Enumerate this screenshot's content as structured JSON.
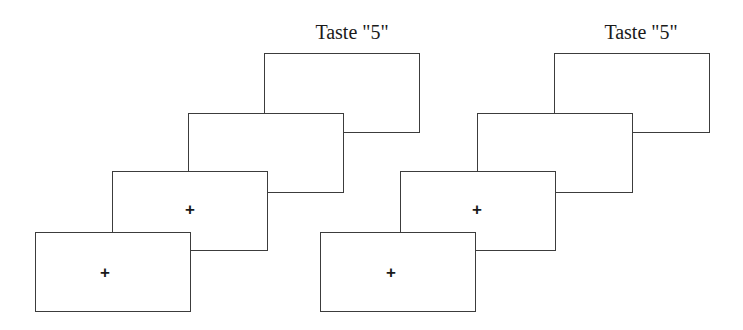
{
  "figure": {
    "canvas": {
      "width": 743,
      "height": 330
    },
    "background_color": "#ffffff",
    "line_color": "#3c3c3c",
    "text_color": "#1a1a1a",
    "fixation_glyph": "+"
  },
  "sequences": [
    {
      "id": "sequence-left",
      "name": "left-trial-sequence",
      "key_label": {
        "text": "Taste \"5\"",
        "x": 352,
        "y": 22
      },
      "screens": [
        {
          "id": "left-screen-4",
          "name": "left-screen-4-response",
          "order": 4,
          "x": 264,
          "y": 53,
          "width": 156,
          "height": 80,
          "fixation": null
        },
        {
          "id": "left-screen-3",
          "name": "left-screen-3-blank",
          "order": 3,
          "x": 188,
          "y": 113,
          "width": 156,
          "height": 80,
          "fixation": null
        },
        {
          "id": "left-screen-2",
          "name": "left-screen-2-fixation",
          "order": 2,
          "x": 112,
          "y": 171,
          "width": 156,
          "height": 80,
          "fixation": {
            "x": 190,
            "y": 209
          }
        },
        {
          "id": "left-screen-1",
          "name": "left-screen-1-fixation",
          "order": 1,
          "x": 35,
          "y": 232,
          "width": 156,
          "height": 80,
          "fixation": {
            "x": 105,
            "y": 272
          }
        }
      ]
    },
    {
      "id": "sequence-right",
      "name": "right-trial-sequence",
      "key_label": {
        "text": "Taste \"5\"",
        "x": 641,
        "y": 22
      },
      "screens": [
        {
          "id": "right-screen-4",
          "name": "right-screen-4-response",
          "order": 4,
          "x": 554,
          "y": 53,
          "width": 156,
          "height": 80,
          "fixation": null
        },
        {
          "id": "right-screen-3",
          "name": "right-screen-3-blank",
          "order": 3,
          "x": 477,
          "y": 113,
          "width": 156,
          "height": 80,
          "fixation": null
        },
        {
          "id": "right-screen-2",
          "name": "right-screen-2-fixation",
          "order": 2,
          "x": 400,
          "y": 171,
          "width": 156,
          "height": 80,
          "fixation": {
            "x": 477,
            "y": 209
          }
        },
        {
          "id": "right-screen-1",
          "name": "right-screen-1-fixation",
          "order": 1,
          "x": 320,
          "y": 232,
          "width": 156,
          "height": 80,
          "fixation": {
            "x": 391,
            "y": 272
          }
        }
      ]
    }
  ]
}
